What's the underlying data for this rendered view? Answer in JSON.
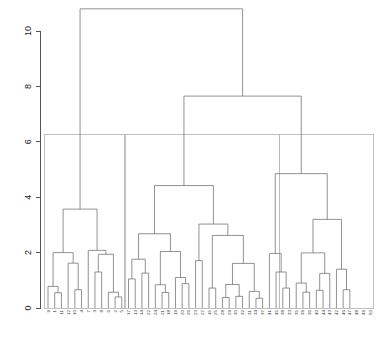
{
  "figure": {
    "kind": "dendrogram",
    "background_color": "#ffffff",
    "link_color": "#6e6e6e",
    "rect_color": "#b9b9b9",
    "axis_color": "#555555",
    "width": 381,
    "height": 339
  },
  "chart_data": {
    "type": "line",
    "subtype": "dendrogram",
    "title": "",
    "subtitle": "",
    "xlabel": "",
    "ylabel": "",
    "grid": false,
    "legend": "none",
    "ylim": [
      0,
      10.8
    ],
    "yticks": [
      0,
      2,
      4,
      6,
      8,
      10
    ],
    "ytick_labels": [
      "0",
      "2",
      "4",
      "6",
      "8",
      "10"
    ],
    "xtick_labels": [
      "9",
      "1",
      "11",
      "12",
      "10",
      "4",
      "7",
      "3",
      "8",
      "6",
      "2",
      "5",
      "17",
      "13",
      "14",
      "22",
      "24",
      "21",
      "18",
      "19",
      "20",
      "26",
      "23",
      "27",
      "15",
      "25",
      "28",
      "29",
      "30",
      "32",
      "31",
      "34",
      "37",
      "41",
      "45",
      "38",
      "33",
      "35",
      "39",
      "36",
      "40",
      "44",
      "43",
      "42",
      "46",
      "47",
      "48",
      "49"
    ],
    "n_leaves": 49,
    "cut_height": 6.25,
    "n_clusters": 3,
    "cluster_sizes": [
      12,
      23,
      14
    ],
    "root_height": 10.8,
    "merges": [
      {
        "height": 10.8,
        "children": [
          "cluster-1-root",
          "node-right-pair"
        ]
      },
      {
        "height": 7.65,
        "children": [
          "cluster-2-root",
          "cluster-3-root"
        ]
      },
      {
        "height": 3.57,
        "cluster": 1
      },
      {
        "height": 4.42,
        "cluster": 2
      },
      {
        "height": 4.85,
        "cluster": 3
      }
    ],
    "cluster_rect_top": 6.25,
    "cluster_rect_bottom": 0.0,
    "clusters": [
      {
        "id": 1,
        "leaf_count": 12,
        "top_merge_height": 3.57,
        "merge_heights": [
          3.57,
          2.0,
          1.62,
          0.78,
          0.55,
          0.66,
          2.08,
          1.94,
          0.57
        ]
      },
      {
        "id": 2,
        "leaf_count": 23,
        "top_merge_height": 4.42,
        "merge_heights": [
          4.42,
          2.68,
          3.03,
          2.62,
          2.04,
          1.76,
          1.71,
          1.61,
          1.26,
          1.1,
          1.05,
          0.88,
          0.84,
          0.72,
          0.66,
          0.56,
          0.42,
          0.38
        ]
      },
      {
        "id": 3,
        "leaf_count": 14,
        "top_merge_height": 4.85,
        "merge_heights": [
          4.85,
          3.2,
          1.97,
          1.99,
          1.3,
          1.25,
          0.9,
          0.72,
          0.64,
          0.57
        ]
      }
    ]
  },
  "axis": {
    "tick_0": "0",
    "tick_2": "2",
    "tick_4": "4",
    "tick_6": "6",
    "tick_8": "8",
    "tick_10": "10"
  },
  "leaves": [
    {
      "label": "9"
    },
    {
      "label": "1"
    },
    {
      "label": "11"
    },
    {
      "label": "12"
    },
    {
      "label": "10"
    },
    {
      "label": "4"
    },
    {
      "label": "7"
    },
    {
      "label": "3"
    },
    {
      "label": "8"
    },
    {
      "label": "6"
    },
    {
      "label": "2"
    },
    {
      "label": "5"
    },
    {
      "label": "17"
    },
    {
      "label": "13"
    },
    {
      "label": "14"
    },
    {
      "label": "22"
    },
    {
      "label": "24"
    },
    {
      "label": "21"
    },
    {
      "label": "18"
    },
    {
      "label": "19"
    },
    {
      "label": "20"
    },
    {
      "label": "26"
    },
    {
      "label": "23"
    },
    {
      "label": "27"
    },
    {
      "label": "15"
    },
    {
      "label": "25"
    },
    {
      "label": "28"
    },
    {
      "label": "29"
    },
    {
      "label": "30"
    },
    {
      "label": "32"
    },
    {
      "label": "31"
    },
    {
      "label": "34"
    },
    {
      "label": "37"
    },
    {
      "label": "41"
    },
    {
      "label": "45"
    },
    {
      "label": "38"
    },
    {
      "label": "33"
    },
    {
      "label": "35"
    },
    {
      "label": "39"
    },
    {
      "label": "36"
    },
    {
      "label": "40"
    },
    {
      "label": "44"
    },
    {
      "label": "43"
    },
    {
      "label": "42"
    },
    {
      "label": "46"
    },
    {
      "label": "47"
    },
    {
      "label": "48"
    },
    {
      "label": "49"
    },
    {
      "label": "50"
    }
  ]
}
